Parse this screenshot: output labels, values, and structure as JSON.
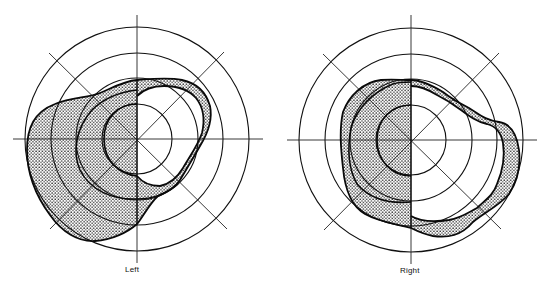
{
  "figure": {
    "type": "visual field perimetry chart (pair)",
    "panels": [
      {
        "label": "Left",
        "center": [
          137,
          139
        ],
        "ring_radii": [
          35,
          61,
          86,
          112
        ],
        "shaded_region": "scotoma band covering temporal (left) half and thin arc on nasal (right) side"
      },
      {
        "label": "Right",
        "center": [
          411,
          140
        ],
        "ring_radii": [
          35,
          61,
          86,
          112
        ],
        "shaded_region": "shaded band over left half plus thick arc wrapping right and lower-right periphery"
      }
    ],
    "colors": {
      "line": "#111111",
      "stipple": "#1a1a1a",
      "background": "#ffffff"
    }
  }
}
